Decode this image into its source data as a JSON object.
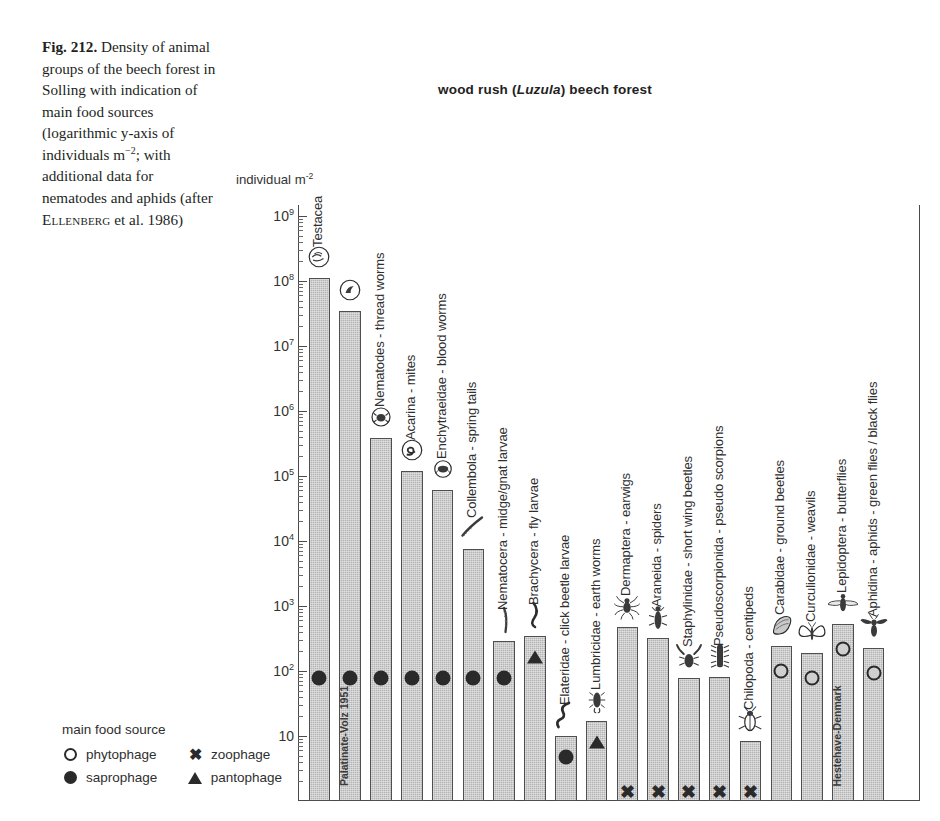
{
  "caption": {
    "figure_number": "Fig. 212.",
    "text_before_author": "Density of animal groups of the beech forest in Solling with indication of main food sources (logarithmic y-axis of individuals m",
    "exponent": "−2",
    "text_middle": "; with additional data for nematodes and aphids (after ",
    "author": "Ellenberg",
    "text_after": " et al. 1986)"
  },
  "chart_title_prefix": "wood rush (",
  "chart_title_italic": "Luzula",
  "chart_title_suffix": ") beech forest",
  "axis": {
    "unit_label_prefix": "individual m",
    "unit_label_exp": "-2",
    "tick_labels": [
      "10⁹",
      "10⁸",
      "10⁷",
      "10⁶",
      "10⁵",
      "10⁴",
      "10³",
      "10²",
      "10"
    ],
    "tick_base": [
      "10",
      "10",
      "10",
      "10",
      "10",
      "10",
      "10",
      "10",
      "10"
    ],
    "tick_exp": [
      "9",
      "8",
      "7",
      "6",
      "5",
      "4",
      "3",
      "2",
      ""
    ]
  },
  "legend": {
    "title": "main food source",
    "items": [
      {
        "symbol": "open-circle",
        "label": "phytophage"
      },
      {
        "symbol": "x-mark",
        "label": "zoophage"
      },
      {
        "symbol": "filled-circle",
        "label": "saprophage"
      },
      {
        "symbol": "triangle",
        "label": "pantophage"
      }
    ]
  },
  "chart_data": {
    "type": "bar",
    "title": "wood rush (Luzula) beech forest",
    "xlabel": "",
    "ylabel": "individual m-2",
    "ylim": [
      1,
      1000000000
    ],
    "yscale": "log",
    "grid": false,
    "legend_position": "bottom-left-outside",
    "categories": [
      "Testacea",
      "Nematodes - thread worms",
      "Acarina - mites",
      "Enchytraeidae - blood worms",
      "Collembola - spring tails",
      "Nematocera - midge/gnat larvae",
      "Brachycera - fly larvae",
      "Elateridae - click beetle larvae",
      "Lumbricidae - earth worms",
      "Dermaptera - earwigs",
      "Araneida - spiders",
      "Staphylinidae - short wing beetles",
      "Pseudoscorpionida - pseudo scorpions",
      "Chilopoda - centipeds",
      "Carabidae - ground beetles",
      "Curculionidae - weavils",
      "Lepidoptera - butterflies",
      "Aphidina - aphids - green flies / black flies",
      "Apocrita - bees and wasps"
    ],
    "bars": [
      {
        "index": 0,
        "taxon": "Testacea",
        "value": 110000000,
        "food_source": "saprophage",
        "icon": "testacea-icon",
        "note": ""
      },
      {
        "index": 1,
        "taxon": "Testacea",
        "value": 35000000,
        "food_source": "saprophage",
        "icon": "nematode-amoeba-icon",
        "note": "Palatinate-Volz 1951"
      },
      {
        "index": 2,
        "taxon": "Nematodes - thread worms",
        "value": 380000,
        "food_source": "saprophage",
        "icon": "mite-icon",
        "note": ""
      },
      {
        "index": 3,
        "taxon": "Acarina - mites",
        "value": 120000,
        "food_source": "saprophage",
        "icon": "enchytraeid-icon",
        "note": ""
      },
      {
        "index": 4,
        "taxon": "Enchytraeidae - blood worms",
        "value": 62000,
        "food_source": "saprophage",
        "icon": "springtail-icon",
        "note": ""
      },
      {
        "index": 5,
        "taxon": "Collembola - spring tails",
        "value": 7500,
        "food_source": "saprophage",
        "icon": "midge-larva-icon",
        "note": ""
      },
      {
        "index": 6,
        "taxon": "Nematocera - midge/gnat larvae",
        "value": 290,
        "food_source": "saprophage",
        "icon": "fly-larva-icon",
        "note": ""
      },
      {
        "index": 7,
        "taxon": "Brachycera - fly larvae",
        "value": 340,
        "food_source": "pantophage",
        "icon": "click-beetle-larva-icon",
        "note": ""
      },
      {
        "index": 8,
        "taxon": "Elateridae - click beetle larvae",
        "value": 10,
        "food_source": "saprophage",
        "icon": "earthworm-icon",
        "note": ""
      },
      {
        "index": 9,
        "taxon": "Lumbricidae - earth worms",
        "value": 17,
        "food_source": "pantophage",
        "icon": "earwig-icon",
        "note": ""
      },
      {
        "index": 10,
        "taxon": "Dermaptera - earwigs",
        "value": 480,
        "food_source": "zoophage",
        "icon": "spider-icon",
        "note": ""
      },
      {
        "index": 11,
        "taxon": "Araneida - spiders",
        "value": 320,
        "food_source": "zoophage",
        "icon": "rove-beetle-icon",
        "note": ""
      },
      {
        "index": 12,
        "taxon": "Staphylinidae - short wing beetles",
        "value": 78,
        "food_source": "zoophage",
        "icon": "pseudoscorpion-icon",
        "note": ""
      },
      {
        "index": 13,
        "taxon": "Pseudoscorpionida - pseudo scorpions",
        "value": 82,
        "food_source": "zoophage",
        "icon": "centipede-icon",
        "note": ""
      },
      {
        "index": 14,
        "taxon": "Chilopoda - centipeds",
        "value": 8.5,
        "food_source": "zoophage",
        "icon": "ground-beetle-icon",
        "note": ""
      },
      {
        "index": 15,
        "taxon": "Carabidae - ground beetles",
        "value": 240,
        "food_source": "phytophage",
        "icon": "weevil-icon",
        "note": ""
      },
      {
        "index": 16,
        "taxon": "Curculionidae - weavils",
        "value": 190,
        "food_source": "phytophage",
        "icon": "butterfly-icon",
        "note": ""
      },
      {
        "index": 17,
        "taxon": "Lepidoptera - butterflies",
        "value": 520,
        "food_source": "phytophage",
        "icon": "aphid-fly-icon",
        "note": "Hestehave-Denmark"
      },
      {
        "index": 18,
        "taxon": "Aphidina - aphids - green flies / black flies",
        "value": 230,
        "food_source": "phytophage",
        "icon": "wasp-icon",
        "note": ""
      }
    ]
  }
}
